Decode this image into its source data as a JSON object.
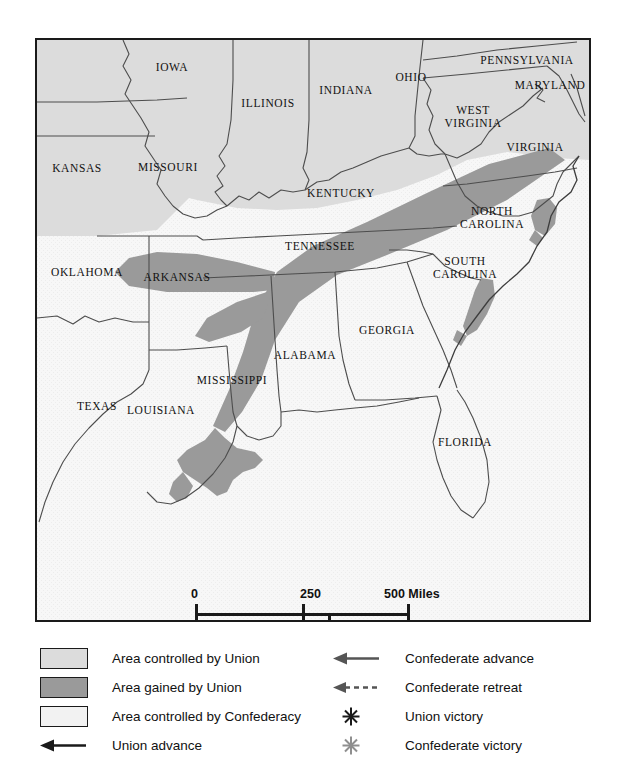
{
  "map": {
    "title": "Civil War Map",
    "colors": {
      "union": "#dcdcdc",
      "gained": "#9a9a9a",
      "confederacy": "#f2f2f2",
      "border": "#1a1a1a",
      "state_line": "#555555"
    },
    "states": [
      {
        "name": "IOWA",
        "x": 135,
        "y": 27,
        "lines": [
          "IOWA"
        ]
      },
      {
        "name": "ILLINOIS",
        "x": 231,
        "y": 63,
        "lines": [
          "ILLINOIS"
        ]
      },
      {
        "name": "INDIANA",
        "x": 309,
        "y": 50,
        "lines": [
          "INDIANA"
        ]
      },
      {
        "name": "OHIO",
        "x": 374,
        "y": 37,
        "lines": [
          "OHIO"
        ]
      },
      {
        "name": "PENNSYLVANIA",
        "x": 490,
        "y": 20,
        "lines": [
          "PENNSYLVANIA"
        ]
      },
      {
        "name": "MARYLAND",
        "x": 513,
        "y": 45,
        "lines": [
          "MARYLAND"
        ]
      },
      {
        "name": "DEL.",
        "x": 571,
        "y": 50,
        "lines": [
          "DEL."
        ]
      },
      {
        "name": "WEST VIRGINIA",
        "x": 436,
        "y": 77,
        "lines": [
          "WEST",
          "VIRGINIA"
        ]
      },
      {
        "name": "VIRGINIA",
        "x": 498,
        "y": 107,
        "lines": [
          "VIRGINIA"
        ]
      },
      {
        "name": "KANSAS",
        "x": 40,
        "y": 128,
        "lines": [
          "KANSAS"
        ]
      },
      {
        "name": "MISSOURI",
        "x": 131,
        "y": 127,
        "lines": [
          "MISSOURI"
        ]
      },
      {
        "name": "KENTUCKY",
        "x": 304,
        "y": 153,
        "lines": [
          "KENTUCKY"
        ]
      },
      {
        "name": "NORTH CAROLINA",
        "x": 455,
        "y": 178,
        "lines": [
          "NORTH",
          "CAROLINA"
        ]
      },
      {
        "name": "TENNESSEE",
        "x": 283,
        "y": 206,
        "lines": [
          "TENNESSEE"
        ]
      },
      {
        "name": "OKLAHOMA",
        "x": 50,
        "y": 232,
        "lines": [
          "OKLAHOMA"
        ]
      },
      {
        "name": "ARKANSAS",
        "x": 140,
        "y": 237,
        "lines": [
          "ARKANSAS"
        ]
      },
      {
        "name": "SOUTH CAROLINA",
        "x": 428,
        "y": 228,
        "lines": [
          "SOUTH",
          "CAROLINA"
        ]
      },
      {
        "name": "GEORGIA",
        "x": 350,
        "y": 290,
        "lines": [
          "GEORGIA"
        ]
      },
      {
        "name": "ALABAMA",
        "x": 268,
        "y": 315,
        "lines": [
          "ALABAMA"
        ]
      },
      {
        "name": "MISSISSIPPI",
        "x": 195,
        "y": 340,
        "lines": [
          "MISSISSIPPI"
        ]
      },
      {
        "name": "LOUISIANA",
        "x": 124,
        "y": 370,
        "lines": [
          "LOUISIANA"
        ]
      },
      {
        "name": "TEXAS",
        "x": 60,
        "y": 366,
        "lines": [
          "TEXAS"
        ]
      },
      {
        "name": "FLORIDA",
        "x": 428,
        "y": 402,
        "lines": [
          "FLORIDA"
        ]
      }
    ]
  },
  "scale": {
    "miles": {
      "start": "0",
      "mid": "250",
      "end": "500 Miles"
    },
    "kilometers": {
      "start": "0",
      "end": "500 Kilometers"
    }
  },
  "legend": {
    "left_column": [
      {
        "symbol": "swatch-union",
        "label": "Area controlled by Union"
      },
      {
        "symbol": "swatch-gained",
        "label": "Area gained by Union"
      },
      {
        "symbol": "swatch-confed",
        "label": "Area controlled by Confederacy"
      },
      {
        "symbol": "arrow-solid",
        "label": "Union advance"
      }
    ],
    "right_column": [
      {
        "symbol": "arrow-solid",
        "label": "Confederate advance"
      },
      {
        "symbol": "arrow-dashed",
        "label": "Confederate retreat"
      },
      {
        "symbol": "star-dark",
        "label": "Union victory"
      },
      {
        "symbol": "star-light",
        "label": "Confederate victory"
      }
    ]
  }
}
